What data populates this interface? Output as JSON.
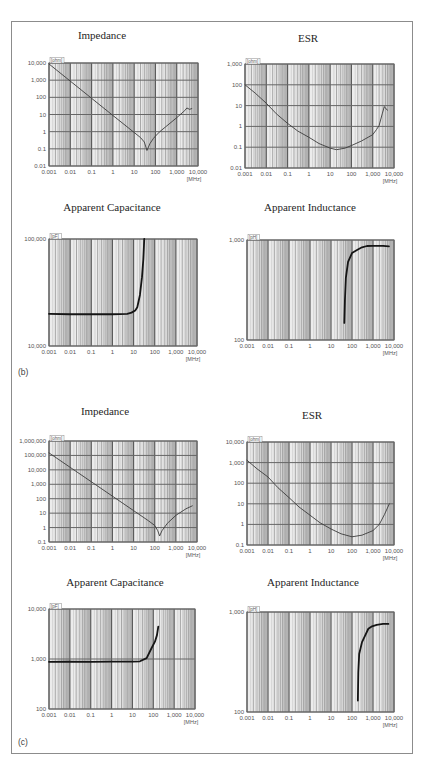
{
  "figure": {
    "panel_b_label": "(b)",
    "panel_c_label": "(c)"
  },
  "chart_data": [
    {
      "panel": "b",
      "title": "Impedance",
      "type": "line",
      "x_scale": "log",
      "y_scale": "log",
      "xlabel": "[MHz]",
      "ylabel": "[ohm]",
      "xlim": [
        0.001,
        10000
      ],
      "ylim": [
        0.01,
        10000
      ],
      "grid": true,
      "x_ticks": [
        {
          "value": 0.001,
          "label": "0.001"
        },
        {
          "value": 0.01,
          "label": "0.01"
        },
        {
          "value": 0.1,
          "label": "0.1"
        },
        {
          "value": 1,
          "label": "1"
        },
        {
          "value": 10,
          "label": "10"
        },
        {
          "value": 100,
          "label": "100"
        },
        {
          "value": 1000,
          "label": "1,000"
        },
        {
          "value": 10000,
          "label": "10,000"
        }
      ],
      "y_ticks": [
        {
          "value": 10000,
          "label": "10,000"
        },
        {
          "value": 1000,
          "label": "1,000"
        },
        {
          "value": 100,
          "label": "100"
        },
        {
          "value": 10,
          "label": "10"
        },
        {
          "value": 1,
          "label": "1"
        },
        {
          "value": 0.1,
          "label": "0.1"
        },
        {
          "value": 0.01,
          "label": "0.01"
        }
      ],
      "points": [
        [
          0.001,
          8800
        ],
        [
          0.01,
          880
        ],
        [
          0.1,
          88
        ],
        [
          1,
          8.8
        ],
        [
          10,
          0.9
        ],
        [
          20,
          0.45
        ],
        [
          30,
          0.25
        ],
        [
          40,
          0.08
        ],
        [
          55,
          0.2
        ],
        [
          80,
          0.4
        ],
        [
          100,
          0.55
        ],
        [
          160,
          1.0
        ],
        [
          300,
          1.9
        ],
        [
          1000,
          6.5
        ],
        [
          2400,
          17
        ],
        [
          3000,
          24
        ],
        [
          4000,
          20
        ],
        [
          5100,
          22
        ]
      ]
    },
    {
      "panel": "b",
      "title": "ESR",
      "type": "line",
      "x_scale": "log",
      "y_scale": "log",
      "xlabel": "[MHz]",
      "ylabel": "[ohm]",
      "xlim": [
        0.001,
        10000
      ],
      "ylim": [
        0.01,
        1000
      ],
      "grid": true,
      "x_ticks": [
        {
          "value": 0.001,
          "label": "0.001"
        },
        {
          "value": 0.01,
          "label": "0.01"
        },
        {
          "value": 0.1,
          "label": "0.1"
        },
        {
          "value": 1,
          "label": "1"
        },
        {
          "value": 10,
          "label": "10"
        },
        {
          "value": 100,
          "label": "100"
        },
        {
          "value": 1000,
          "label": "1,000"
        },
        {
          "value": 10000,
          "label": "10,000"
        }
      ],
      "y_ticks": [
        {
          "value": 1000,
          "label": "1,000"
        },
        {
          "value": 100,
          "label": "100"
        },
        {
          "value": 10,
          "label": "10"
        },
        {
          "value": 1,
          "label": "1"
        },
        {
          "value": 0.1,
          "label": "0.1"
        },
        {
          "value": 0.01,
          "label": "0.01"
        }
      ],
      "points": [
        [
          0.001,
          100
        ],
        [
          0.003,
          40
        ],
        [
          0.01,
          13
        ],
        [
          0.03,
          4
        ],
        [
          0.1,
          1.4
        ],
        [
          0.3,
          0.6
        ],
        [
          1,
          0.3
        ],
        [
          3,
          0.15
        ],
        [
          10,
          0.09
        ],
        [
          20,
          0.076
        ],
        [
          50,
          0.09
        ],
        [
          100,
          0.12
        ],
        [
          300,
          0.2
        ],
        [
          1000,
          0.4
        ],
        [
          1500,
          0.7
        ],
        [
          2000,
          1.1
        ],
        [
          2800,
          4
        ],
        [
          3500,
          9
        ],
        [
          4200,
          7
        ],
        [
          5000,
          6
        ]
      ]
    },
    {
      "panel": "b",
      "title": "Apparent Capacitance",
      "type": "line",
      "x_scale": "log",
      "y_scale": "log",
      "xlabel": "[MHz]",
      "ylabel": "[pF]",
      "xlim": [
        0.001,
        10000
      ],
      "ylim": [
        10000,
        100000
      ],
      "grid": true,
      "x_ticks": [
        {
          "value": 0.001,
          "label": "0.001"
        },
        {
          "value": 0.01,
          "label": "0.01"
        },
        {
          "value": 0.1,
          "label": "0.1"
        },
        {
          "value": 1,
          "label": "1"
        },
        {
          "value": 10,
          "label": "10"
        },
        {
          "value": 100,
          "label": "100"
        },
        {
          "value": 1000,
          "label": "1,000"
        },
        {
          "value": 10000,
          "label": "10,000"
        }
      ],
      "y_ticks": [
        {
          "value": 100000,
          "label": "100,000"
        },
        {
          "value": 10000,
          "label": "10,000"
        }
      ],
      "points": [
        [
          0.001,
          20000
        ],
        [
          0.01,
          19800
        ],
        [
          0.1,
          19800
        ],
        [
          1,
          19800
        ],
        [
          5,
          20000
        ],
        [
          8,
          20500
        ],
        [
          12,
          21500
        ],
        [
          15,
          23000
        ],
        [
          20,
          30000
        ],
        [
          25,
          44000
        ],
        [
          29,
          65000
        ],
        [
          32,
          100000
        ]
      ]
    },
    {
      "panel": "b",
      "title": "Apparent Inductance",
      "type": "line",
      "x_scale": "log",
      "y_scale": "log",
      "xlabel": "[MHz]",
      "ylabel": "[pH]",
      "xlim": [
        0.001,
        10000
      ],
      "ylim": [
        100,
        1000
      ],
      "grid": true,
      "x_ticks": [
        {
          "value": 0.001,
          "label": "0.001"
        },
        {
          "value": 0.01,
          "label": "0.01"
        },
        {
          "value": 0.1,
          "label": "0.1"
        },
        {
          "value": 1,
          "label": "1"
        },
        {
          "value": 10,
          "label": "10"
        },
        {
          "value": 100,
          "label": "100"
        },
        {
          "value": 1000,
          "label": "1,000"
        },
        {
          "value": 10000,
          "label": "10,000"
        }
      ],
      "y_ticks": [
        {
          "value": 1000,
          "label": "1,000"
        },
        {
          "value": 100,
          "label": "100"
        }
      ],
      "points": [
        [
          43,
          148
        ],
        [
          46,
          250
        ],
        [
          51,
          417
        ],
        [
          65,
          603
        ],
        [
          100,
          741
        ],
        [
          173,
          794
        ],
        [
          300,
          845
        ],
        [
          515,
          871
        ],
        [
          1000,
          875
        ],
        [
          3000,
          872
        ],
        [
          5750,
          862
        ]
      ]
    },
    {
      "panel": "c",
      "title": "Impedance",
      "type": "line",
      "x_scale": "log",
      "y_scale": "log",
      "xlabel": "[MHz]",
      "ylabel": "[ohm]",
      "xlim": [
        0.001,
        10000
      ],
      "ylim": [
        0.1,
        1000000
      ],
      "grid": true,
      "x_ticks": [
        {
          "value": 0.001,
          "label": "0.001"
        },
        {
          "value": 0.01,
          "label": "0.01"
        },
        {
          "value": 0.1,
          "label": "0.1"
        },
        {
          "value": 1,
          "label": "1"
        },
        {
          "value": 10,
          "label": "10"
        },
        {
          "value": 100,
          "label": "100"
        },
        {
          "value": 1000,
          "label": "1,000"
        },
        {
          "value": 10000,
          "label": "10,000"
        }
      ],
      "y_ticks": [
        {
          "value": 1000000,
          "label": "1,000,000"
        },
        {
          "value": 100000,
          "label": "100,000"
        },
        {
          "value": 10000,
          "label": "10,000"
        },
        {
          "value": 1000,
          "label": "1,000"
        },
        {
          "value": 100,
          "label": "100"
        },
        {
          "value": 10,
          "label": "10"
        },
        {
          "value": 1,
          "label": "1"
        },
        {
          "value": 0.1,
          "label": "0.1"
        }
      ],
      "points": [
        [
          0.001,
          150000
        ],
        [
          0.01,
          15000
        ],
        [
          0.1,
          1500
        ],
        [
          1,
          150
        ],
        [
          10,
          15
        ],
        [
          50,
          3
        ],
        [
          100,
          1.4
        ],
        [
          140,
          0.6
        ],
        [
          170,
          0.26
        ],
        [
          220,
          0.6
        ],
        [
          400,
          2
        ],
        [
          1000,
          7
        ],
        [
          3000,
          20
        ],
        [
          6000,
          32
        ]
      ]
    },
    {
      "panel": "c",
      "title": "ESR",
      "type": "line",
      "x_scale": "log",
      "y_scale": "log",
      "xlabel": "[MHz]",
      "ylabel": "[ohm]",
      "xlim": [
        0.001,
        10000
      ],
      "ylim": [
        0.1,
        10000
      ],
      "grid": true,
      "x_ticks": [
        {
          "value": 0.001,
          "label": "0.001"
        },
        {
          "value": 0.01,
          "label": "0.01"
        },
        {
          "value": 0.1,
          "label": "0.1"
        },
        {
          "value": 1,
          "label": "1"
        },
        {
          "value": 10,
          "label": "10"
        },
        {
          "value": 100,
          "label": "100"
        },
        {
          "value": 1000,
          "label": "1,000"
        },
        {
          "value": 10000,
          "label": "10,000"
        }
      ],
      "y_ticks": [
        {
          "value": 10000,
          "label": "10,000"
        },
        {
          "value": 1000,
          "label": "1,000"
        },
        {
          "value": 100,
          "label": "100"
        },
        {
          "value": 10,
          "label": "10"
        },
        {
          "value": 1,
          "label": "1"
        },
        {
          "value": 0.1,
          "label": "0.1"
        }
      ],
      "points": [
        [
          0.001,
          1300
        ],
        [
          0.003,
          500
        ],
        [
          0.01,
          200
        ],
        [
          0.03,
          60
        ],
        [
          0.1,
          20
        ],
        [
          0.3,
          7
        ],
        [
          1,
          2.8
        ],
        [
          3,
          1.2
        ],
        [
          10,
          0.6
        ],
        [
          30,
          0.35
        ],
        [
          100,
          0.25
        ],
        [
          300,
          0.3
        ],
        [
          1000,
          0.5
        ],
        [
          2000,
          1
        ],
        [
          3500,
          3
        ],
        [
          6000,
          10
        ]
      ]
    },
    {
      "panel": "c",
      "title": "Apparent Capacitance",
      "type": "line",
      "x_scale": "log",
      "y_scale": "log",
      "xlabel": "[MHz]",
      "ylabel": "[pF]",
      "xlim": [
        0.001,
        10000
      ],
      "ylim": [
        100,
        10000
      ],
      "grid": true,
      "x_ticks": [
        {
          "value": 0.001,
          "label": "0.001"
        },
        {
          "value": 0.01,
          "label": "0.01"
        },
        {
          "value": 0.1,
          "label": "0.1"
        },
        {
          "value": 1,
          "label": "1"
        },
        {
          "value": 10,
          "label": "10"
        },
        {
          "value": 100,
          "label": "100"
        },
        {
          "value": 1000,
          "label": "1,000"
        },
        {
          "value": 10000,
          "label": "10,000"
        }
      ],
      "y_ticks": [
        {
          "value": 10000,
          "label": "10,000"
        },
        {
          "value": 1000,
          "label": "1,000"
        },
        {
          "value": 100,
          "label": "100"
        }
      ],
      "points": [
        [
          0.001,
          880
        ],
        [
          0.01,
          890
        ],
        [
          0.1,
          880
        ],
        [
          1,
          885
        ],
        [
          10,
          890
        ],
        [
          23,
          900
        ],
        [
          48,
          1040
        ],
        [
          83,
          1660
        ],
        [
          120,
          2220
        ],
        [
          150,
          3000
        ],
        [
          174,
          4430
        ]
      ]
    },
    {
      "panel": "c",
      "title": "Apparent Inductance",
      "type": "line",
      "x_scale": "log",
      "y_scale": "log",
      "xlabel": "[MHz]",
      "ylabel": "[pH]",
      "xlim": [
        0.001,
        10000
      ],
      "ylim": [
        100,
        1000
      ],
      "grid": true,
      "x_ticks": [
        {
          "value": 0.001,
          "label": "0.001"
        },
        {
          "value": 0.01,
          "label": "0.01"
        },
        {
          "value": 0.1,
          "label": "0.1"
        },
        {
          "value": 1,
          "label": "1"
        },
        {
          "value": 10,
          "label": "10"
        },
        {
          "value": 100,
          "label": "100"
        },
        {
          "value": 1000,
          "label": "1,000"
        },
        {
          "value": 10000,
          "label": "10,000"
        }
      ],
      "y_ticks": [
        {
          "value": 1000,
          "label": "1,000"
        },
        {
          "value": 100,
          "label": "100"
        }
      ],
      "points": [
        [
          190,
          130
        ],
        [
          200,
          250
        ],
        [
          220,
          380
        ],
        [
          300,
          500
        ],
        [
          420,
          580
        ],
        [
          600,
          680
        ],
        [
          900,
          720
        ],
        [
          1500,
          745
        ],
        [
          3000,
          760
        ],
        [
          5400,
          760
        ]
      ]
    }
  ]
}
